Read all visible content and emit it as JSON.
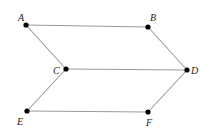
{
  "diagram": {
    "type": "geometric-figure",
    "colors": {
      "edge": "#9a9a9a",
      "point": "#000000",
      "label": "#222222",
      "background": "#ffffff"
    },
    "points": [
      {
        "id": "A",
        "label": "A",
        "x": 26,
        "y": 25,
        "lx": 18,
        "ly": 21
      },
      {
        "id": "B",
        "label": "B",
        "x": 148,
        "y": 27,
        "lx": 150,
        "ly": 21
      },
      {
        "id": "C",
        "label": "C",
        "x": 66,
        "y": 69,
        "lx": 53,
        "ly": 74
      },
      {
        "id": "D",
        "label": "D",
        "x": 187,
        "y": 70,
        "lx": 191,
        "ly": 74
      },
      {
        "id": "E",
        "label": "E",
        "x": 27,
        "y": 111,
        "lx": 17,
        "ly": 125
      },
      {
        "id": "F",
        "label": "F",
        "x": 148,
        "y": 112,
        "lx": 146,
        "ly": 126
      }
    ],
    "edges": [
      {
        "from": "A",
        "to": "B"
      },
      {
        "from": "A",
        "to": "C"
      },
      {
        "from": "B",
        "to": "D"
      },
      {
        "from": "C",
        "to": "D"
      },
      {
        "from": "C",
        "to": "E"
      },
      {
        "from": "D",
        "to": "F"
      },
      {
        "from": "E",
        "to": "F"
      }
    ]
  }
}
